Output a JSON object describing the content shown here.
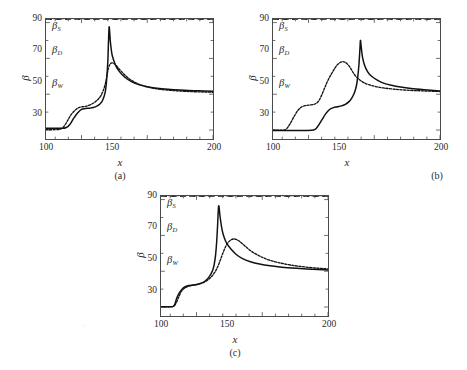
{
  "figure": {
    "background": "#ffffff",
    "ink_color": "#1a1a1a",
    "panels": [
      {
        "id": "a",
        "caption": "(a)",
        "xlabel": "x",
        "ylabel": "β"
      },
      {
        "id": "b",
        "caption": "(b)",
        "xlabel": "x",
        "ylabel": "β"
      },
      {
        "id": "c",
        "caption": "(c)",
        "xlabel": "x",
        "ylabel": "β"
      }
    ]
  },
  "axes": {
    "x_ticks": [
      "100",
      "150",
      "200"
    ],
    "y_ticks": [
      "30",
      "50",
      "70",
      "90"
    ],
    "xlabel": "x",
    "ylabel": "β",
    "xlim": [
      73,
      200
    ],
    "ylim": [
      25,
      92
    ]
  },
  "reference_lines": {
    "beta_s": {
      "symbol": "β",
      "subscript": "S",
      "value": 81,
      "style": "thick-dashed",
      "color": "#1a1a1a"
    },
    "beta_d": {
      "symbol": "β",
      "subscript": "D",
      "value": 68,
      "style": "thick-dashed",
      "color": "#1a1a1a"
    },
    "beta_w": {
      "symbol": "β",
      "subscript": "W",
      "value": 48.5,
      "style": "thin-dashed",
      "color": "#8a8a8a"
    }
  },
  "chart_data": [
    {
      "type": "line",
      "title": "(a)",
      "xlabel": "x",
      "ylabel": "β",
      "xlim": [
        73,
        200
      ],
      "ylim": [
        25,
        92
      ],
      "x_ticks": [
        100,
        150,
        200
      ],
      "y_ticks": [
        30,
        50,
        70,
        90
      ],
      "grid": false,
      "legend": "none",
      "annotations": [
        {
          "text": "β_S",
          "x": 82,
          "y": 84.5
        },
        {
          "text": "β_D",
          "x": 82,
          "y": 71.5
        },
        {
          "text": "β_W",
          "x": 82,
          "y": 53
        }
      ],
      "hlines": [
        {
          "name": "β_S",
          "y": 81,
          "style": "dashed-thick"
        },
        {
          "name": "β_D",
          "y": 68,
          "style": "dashed-thick"
        },
        {
          "name": "β_W",
          "y": 48.5,
          "style": "dashed-thin"
        }
      ],
      "series": [
        {
          "name": "solid",
          "style": "solid",
          "x": [
            73,
            80,
            85,
            88,
            91,
            94,
            97,
            100,
            103,
            106,
            109,
            112,
            114,
            116,
            118,
            119,
            120,
            120.5,
            121,
            121.5,
            122,
            123,
            124,
            126,
            129,
            133,
            138,
            144,
            151,
            159,
            168,
            178,
            189,
            200
          ],
          "y": [
            31,
            31,
            31,
            31.3,
            33,
            36.5,
            39.5,
            41.5,
            42,
            42.2,
            42.6,
            43.5,
            44.5,
            46.5,
            51,
            57,
            68,
            79,
            87.5,
            84,
            79,
            73,
            70,
            66,
            62.5,
            59.5,
            57,
            55.2,
            54,
            53.2,
            52.6,
            52.2,
            51.9,
            51.6
          ]
        },
        {
          "name": "dotted",
          "style": "dotted",
          "x": [
            73,
            80,
            84,
            86,
            88,
            90,
            92,
            95,
            98,
            101,
            104,
            107,
            110,
            113,
            115,
            117,
            118.5,
            119.5,
            120.5,
            121.5,
            123,
            125,
            127,
            130,
            134,
            139,
            145,
            152,
            160,
            169,
            179,
            190,
            200
          ],
          "y": [
            30.2,
            30.2,
            30.5,
            31.5,
            33.5,
            36,
            38.5,
            41,
            42.5,
            43,
            43.4,
            44.2,
            45.5,
            47.5,
            49.5,
            53,
            57,
            61,
            64.5,
            66.5,
            67.5,
            67,
            65.5,
            63,
            60,
            57.3,
            55.2,
            53.7,
            52.7,
            52.1,
            51.6,
            51.3,
            51.1
          ]
        }
      ]
    },
    {
      "type": "line",
      "title": "(b)",
      "xlabel": "x",
      "ylabel": "β",
      "xlim": [
        73,
        200
      ],
      "ylim": [
        25,
        92
      ],
      "x_ticks": [
        100,
        150,
        200
      ],
      "y_ticks": [
        30,
        50,
        70,
        90
      ],
      "grid": false,
      "legend": "none",
      "annotations": [
        {
          "text": "β_S",
          "x": 82,
          "y": 84.5
        },
        {
          "text": "β_D",
          "x": 82,
          "y": 71.5
        },
        {
          "text": "β_W",
          "x": 82,
          "y": 53
        }
      ],
      "hlines": [
        {
          "name": "β_S",
          "y": 81,
          "style": "dashed-thick"
        },
        {
          "name": "β_D",
          "y": 68,
          "style": "dashed-thick"
        },
        {
          "name": "β_W",
          "y": 48.5,
          "style": "dashed-thin"
        }
      ],
      "series": [
        {
          "name": "solid",
          "style": "solid",
          "x": [
            73,
            85,
            95,
            104,
            107,
            110,
            113,
            116,
            119,
            122,
            125,
            128,
            131,
            133,
            135,
            136.5,
            137.5,
            138.3,
            139,
            139.5,
            140,
            141,
            142.5,
            145,
            148,
            152,
            157,
            163,
            170,
            178,
            188,
            200
          ],
          "y": [
            29.8,
            29.8,
            29.8,
            30,
            32,
            35.5,
            39,
            41.5,
            42.5,
            43,
            43.5,
            44.3,
            46,
            48,
            51,
            55,
            60,
            66,
            74,
            80,
            77,
            71,
            66.5,
            62.5,
            60,
            58,
            56.2,
            55,
            54,
            53.2,
            52.5,
            51.8
          ]
        },
        {
          "name": "dotted",
          "style": "dotted",
          "x": [
            73,
            80,
            83,
            86,
            89,
            92,
            95,
            98,
            101,
            104,
            106,
            108,
            110,
            112,
            114,
            116,
            118,
            120,
            122,
            124,
            126,
            128,
            130,
            132,
            134,
            136,
            139,
            142,
            146,
            151,
            157,
            164,
            172,
            182,
            200
          ],
          "y": [
            30,
            30,
            30.5,
            33.5,
            37.5,
            41,
            43,
            43.7,
            44,
            44.3,
            45,
            46.5,
            49.5,
            53,
            56.5,
            59.5,
            62,
            64.5,
            66.5,
            67.7,
            68.2,
            67.8,
            66.5,
            64.5,
            62,
            60,
            58,
            56.5,
            55.3,
            54.3,
            53.5,
            52.9,
            52.4,
            52,
            51.5
          ]
        }
      ]
    },
    {
      "type": "line",
      "title": "(c)",
      "xlabel": "x",
      "ylabel": "β",
      "xlim": [
        73,
        200
      ],
      "ylim": [
        25,
        92
      ],
      "x_ticks": [
        100,
        150,
        200
      ],
      "y_ticks": [
        30,
        50,
        70,
        90
      ],
      "grid": false,
      "legend": "none",
      "annotations": [
        {
          "text": "β_S",
          "x": 82,
          "y": 84.5
        },
        {
          "text": "β_D",
          "x": 82,
          "y": 71.5
        },
        {
          "text": "β_W",
          "x": 82,
          "y": 53
        }
      ],
      "hlines": [
        {
          "name": "β_S",
          "y": 81,
          "style": "dashed-thick"
        },
        {
          "name": "β_D",
          "y": 68,
          "style": "dashed-thick"
        },
        {
          "name": "β_W",
          "y": 48.5,
          "style": "dashed-thin"
        }
      ],
      "series": [
        {
          "name": "solid",
          "style": "solid",
          "x": [
            73,
            79,
            82,
            83.5,
            85,
            87,
            89,
            91,
            94,
            97,
            100,
            103,
            105,
            107,
            109,
            111,
            112.5,
            113.5,
            114.5,
            115.3,
            116,
            116.5,
            117,
            118,
            119.5,
            121,
            123,
            126,
            130,
            135,
            141,
            148,
            156,
            165,
            176,
            188,
            200
          ],
          "y": [
            30.2,
            30.2,
            30.2,
            31.5,
            35,
            38,
            40,
            41.2,
            42,
            42.3,
            42.6,
            43.2,
            43.8,
            44.8,
            46.3,
            48.5,
            51,
            54,
            59,
            66,
            75,
            83,
            86.5,
            80,
            73,
            69,
            65.5,
            62.5,
            59.5,
            57,
            55.3,
            54,
            53,
            52.2,
            51.6,
            51.1,
            50.7
          ]
        },
        {
          "name": "dotted",
          "style": "dotted",
          "x": [
            73,
            80,
            83,
            85,
            87,
            89,
            92,
            95,
            98,
            101,
            104,
            107,
            110,
            112,
            114,
            115.5,
            117,
            118.5,
            120,
            122,
            124,
            126,
            128,
            130,
            133,
            137,
            142,
            148,
            155,
            163,
            172,
            182,
            192,
            200
          ],
          "y": [
            30.2,
            30.2,
            30.6,
            33,
            36.5,
            39.3,
            41,
            41.8,
            42.2,
            42.6,
            43.3,
            44.3,
            46,
            47.5,
            49.5,
            51.5,
            54,
            57,
            60,
            63.5,
            66,
            67.4,
            68,
            67.8,
            66.5,
            64,
            61,
            58.5,
            56.3,
            54.7,
            53.4,
            52.4,
            51.7,
            51.3
          ]
        }
      ]
    }
  ]
}
